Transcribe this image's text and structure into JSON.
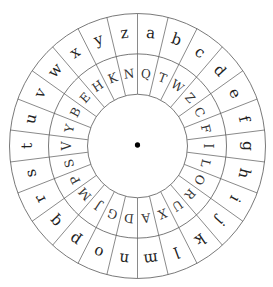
{
  "diagram": {
    "type": "cipher-wheel",
    "segments": 26,
    "outer_ring": {
      "label": "plaintext",
      "letters": [
        "a",
        "b",
        "c",
        "d",
        "e",
        "f",
        "g",
        "h",
        "i",
        "j",
        "k",
        "l",
        "m",
        "n",
        "o",
        "p",
        "q",
        "r",
        "s",
        "t",
        "u",
        "v",
        "w",
        "x",
        "y",
        "z"
      ]
    },
    "inner_ring": {
      "label": "ciphertext",
      "letters": [
        "Q",
        "T",
        "W",
        "Z",
        "C",
        "F",
        "I",
        "L",
        "O",
        "R",
        "U",
        "X",
        "A",
        "D",
        "G",
        "J",
        "M",
        "P",
        "S",
        "V",
        "Y",
        "B",
        "E",
        "H",
        "K",
        "N"
      ]
    },
    "center_dot": true,
    "colors": {
      "line": "#5a5a5a",
      "text": "#222222",
      "background": "#ffffff"
    }
  }
}
